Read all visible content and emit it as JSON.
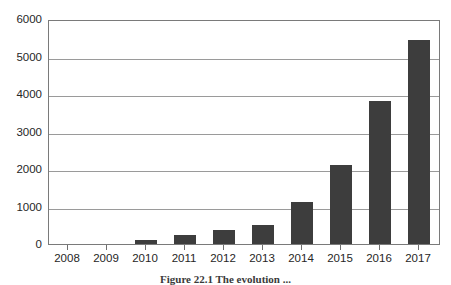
{
  "chart_data": {
    "type": "bar",
    "title": "",
    "xlabel": "",
    "ylabel": "",
    "categories": [
      "2008",
      "2009",
      "2010",
      "2011",
      "2012",
      "2013",
      "2014",
      "2015",
      "2016",
      "2017"
    ],
    "values": [
      0,
      0,
      110,
      240,
      370,
      500,
      1120,
      2130,
      3850,
      5500
    ],
    "series": [
      {
        "name": "",
        "values": [
          0,
          0,
          110,
          240,
          370,
          500,
          1120,
          2130,
          3850,
          5500
        ]
      }
    ],
    "ylim": [
      0,
      6000
    ],
    "y_ticks": [
      "0",
      "1000",
      "2000",
      "3000",
      "4000",
      "5000",
      "6000"
    ],
    "y_tick_values": [
      0,
      1000,
      2000,
      3000,
      4000,
      5000,
      6000
    ],
    "grid": true,
    "legend": "none",
    "bar_color": "#3d3d3d",
    "gridline_color": "#9a9a9a",
    "frame_color": "#7a7a7a"
  },
  "caption": {
    "text": "Figure 22.1   The evolution ..."
  }
}
